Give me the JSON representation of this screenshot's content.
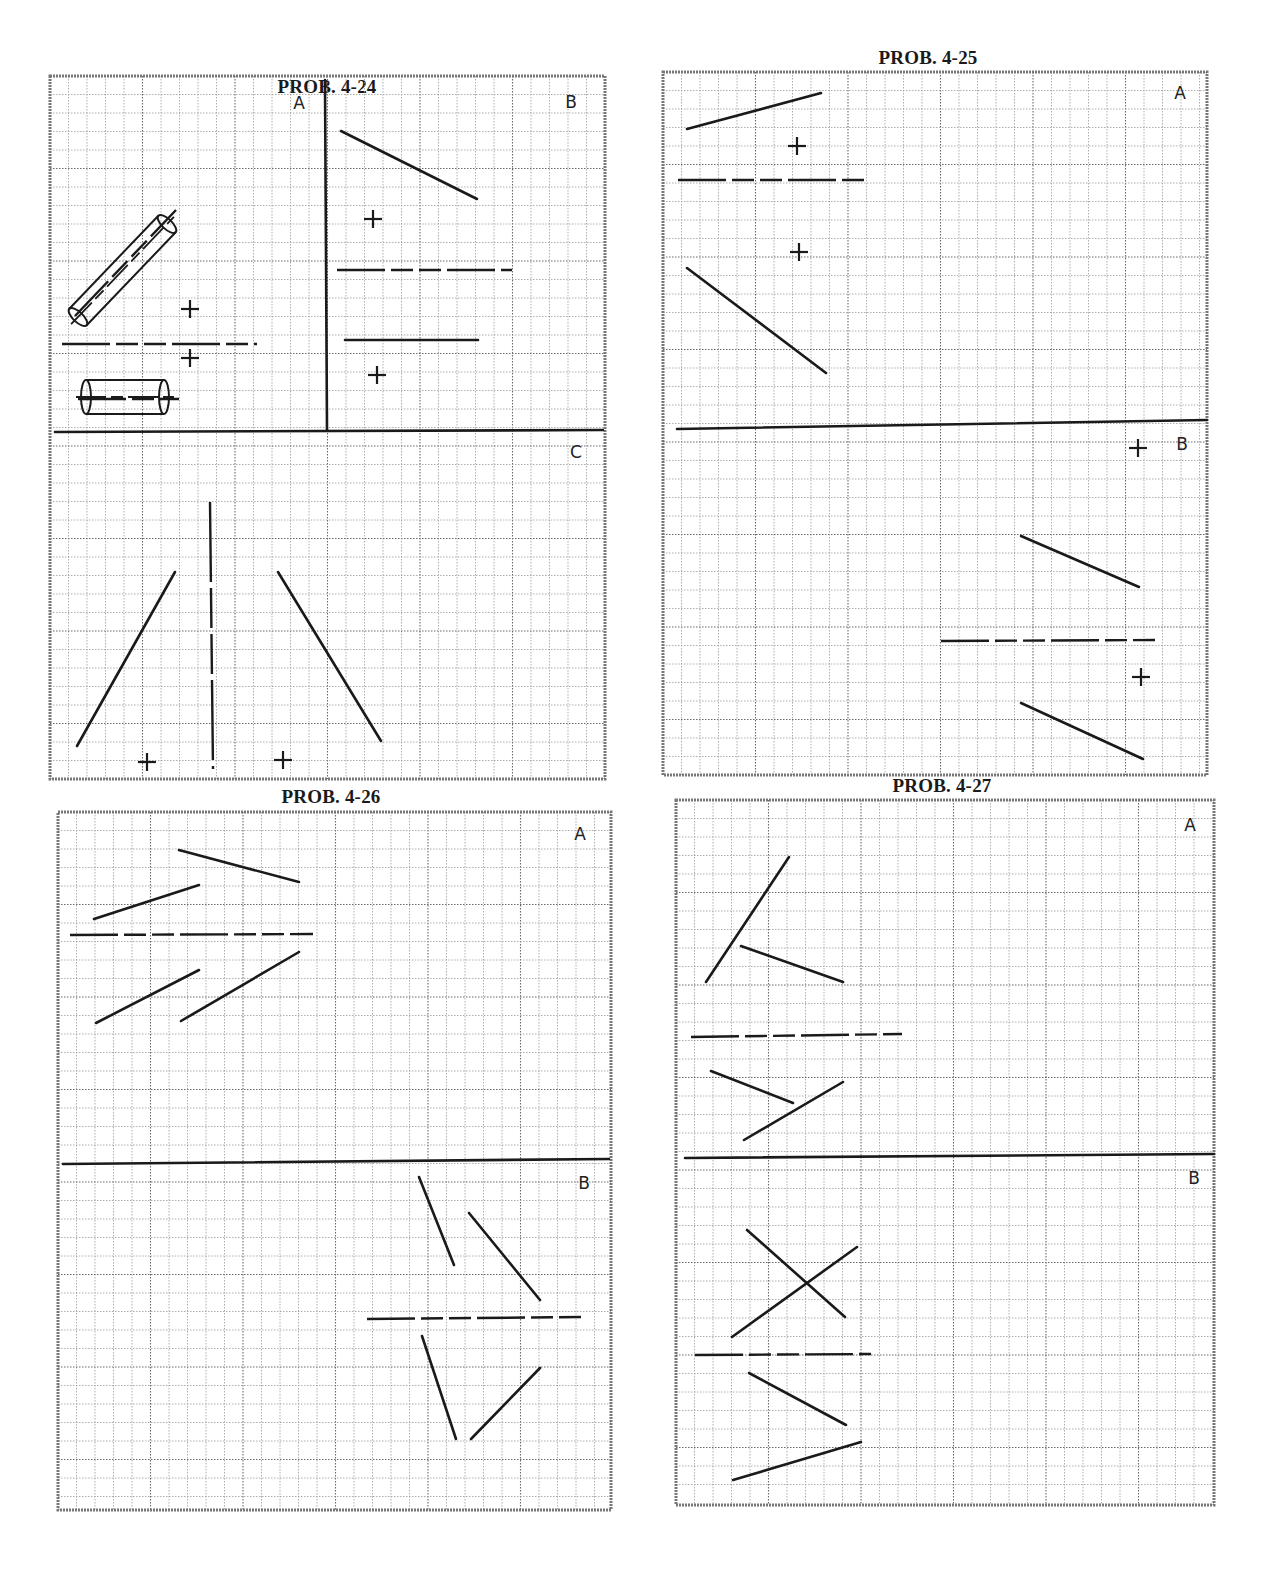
{
  "page": {
    "width": 1288,
    "height": 1596
  },
  "colors": {
    "ink": "#1a1a1a",
    "grid_minor": "#9a9a9a",
    "grid_major": "#6a6a6a",
    "border": "#777777",
    "paper": "#ffffff"
  },
  "problems": [
    {
      "id": "p24",
      "title": "PROB. 4-24",
      "title_pos": [
        327,
        92
      ],
      "box": [
        50,
        76,
        555,
        703
      ],
      "cell": 18.5,
      "labels": [
        {
          "text": "A",
          "x": 299,
          "y": 103
        },
        {
          "text": "B",
          "x": 571,
          "y": 102
        },
        {
          "text": "C",
          "x": 576,
          "y": 452
        }
      ],
      "solid_lines": [
        [
          325,
          80,
          327,
          430
        ],
        [
          55,
          432,
          603,
          430
        ],
        [
          341,
          131,
          477,
          199
        ],
        [
          345,
          340,
          478,
          340
        ],
        [
          77,
          746,
          175,
          572
        ],
        [
          278,
          572,
          381,
          741
        ]
      ],
      "dashed_lines": [
        [
          62,
          344,
          257,
          344
        ],
        [
          337,
          270,
          512,
          270
        ],
        [
          78,
          399,
          179,
          399
        ],
        [
          75,
          316,
          176,
          210
        ]
      ],
      "vertical_dashed": [
        [
          210,
          502,
          213,
          769
        ]
      ],
      "crosses": [
        [
          190,
          309
        ],
        [
          190,
          358
        ],
        [
          373,
          219
        ],
        [
          377,
          375
        ],
        [
          147,
          762
        ],
        [
          283,
          760
        ]
      ],
      "cylinders": [
        {
          "type": "inclined",
          "x1": 78,
          "y1": 317,
          "x2": 167,
          "y2": 224,
          "r": 12
        },
        {
          "type": "horizontal",
          "x1": 86,
          "y1": 397,
          "x2": 164,
          "y2": 397,
          "r": 17
        }
      ]
    },
    {
      "id": "p25",
      "title": "PROB. 4-25",
      "title_pos": [
        928,
        63
      ],
      "box": [
        663,
        72,
        544,
        703
      ],
      "cell": 18.5,
      "labels": [
        {
          "text": "A",
          "x": 1180,
          "y": 93
        },
        {
          "text": "B",
          "x": 1182,
          "y": 444
        }
      ],
      "solid_lines": [
        [
          677,
          429,
          1207,
          420
        ],
        [
          687,
          129,
          821,
          93
        ],
        [
          687,
          268,
          826,
          373
        ],
        [
          1021,
          536,
          1139,
          587
        ],
        [
          1021,
          703,
          1143,
          759
        ]
      ],
      "dashed_lines": [
        [
          678,
          180,
          866,
          180
        ],
        [
          941,
          641,
          1160,
          640
        ]
      ],
      "vertical_dashed": [],
      "crosses": [
        [
          797,
          146
        ],
        [
          799,
          252
        ],
        [
          1138,
          448
        ],
        [
          1141,
          677
        ]
      ],
      "cylinders": []
    },
    {
      "id": "p26",
      "title": "PROB. 4-26",
      "title_pos": [
        331,
        802
      ],
      "box": [
        58,
        812,
        553,
        698
      ],
      "cell": 18.5,
      "labels": [
        {
          "text": "A",
          "x": 580,
          "y": 834
        },
        {
          "text": "B",
          "x": 584,
          "y": 1183
        }
      ],
      "solid_lines": [
        [
          63,
          1164,
          609,
          1159
        ],
        [
          179,
          850,
          299,
          882
        ],
        [
          94,
          919,
          199,
          885
        ],
        [
          96,
          1023,
          199,
          970
        ],
        [
          181,
          1021,
          299,
          952
        ],
        [
          419,
          1177,
          454,
          1265
        ],
        [
          469,
          1213,
          540,
          1300
        ],
        [
          422,
          1336,
          456,
          1439
        ],
        [
          471,
          1439,
          540,
          1368
        ]
      ],
      "dashed_lines": [
        [
          70,
          935,
          313,
          934
        ],
        [
          367,
          1319,
          583,
          1317
        ]
      ],
      "vertical_dashed": [],
      "crosses": [],
      "cylinders": []
    },
    {
      "id": "p27",
      "title": "PROB. 4-27",
      "title_pos": [
        942,
        791
      ],
      "box": [
        676,
        800,
        538,
        705
      ],
      "cell": 18.5,
      "labels": [
        {
          "text": "A",
          "x": 1190,
          "y": 825
        },
        {
          "text": "B",
          "x": 1194,
          "y": 1178
        }
      ],
      "solid_lines": [
        [
          685,
          1158,
          1214,
          1154
        ],
        [
          706,
          982,
          789,
          857
        ],
        [
          741,
          946,
          843,
          982
        ],
        [
          711,
          1071,
          793,
          1103
        ],
        [
          744,
          1140,
          843,
          1082
        ],
        [
          747,
          1230,
          845,
          1317
        ],
        [
          732,
          1337,
          857,
          1247
        ],
        [
          749,
          1373,
          846,
          1425
        ],
        [
          733,
          1480,
          861,
          1442
        ]
      ],
      "dashed_lines": [
        [
          691,
          1037,
          902,
          1034
        ],
        [
          695,
          1355,
          871,
          1354
        ]
      ],
      "vertical_dashed": [],
      "crosses": [],
      "cylinders": []
    }
  ]
}
